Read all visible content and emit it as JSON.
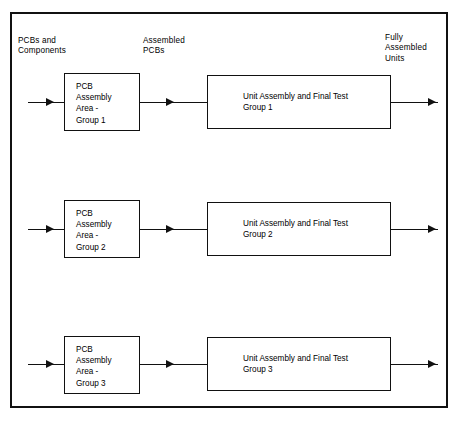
{
  "diagram": {
    "captions": {
      "inputs": "PCBs and\nComponents",
      "intermediate": "Assembled\nPCBs",
      "outputs": "Fully\nAssembled\nUnits"
    },
    "colors": {
      "background": "#ffffff",
      "line": "#111111",
      "text": "#000000",
      "frame": "#111111"
    },
    "rows": [
      {
        "id": "group-1",
        "pcb_box": "PCB\nAssembly\nArea   -\nGroup  1",
        "unit_box": "Unit Assembly  and  Final  Test\nGroup  1"
      },
      {
        "id": "group-2",
        "pcb_box": "PCB\nAssembly\nArea   -\nGroup  2",
        "unit_box": "Unit Assembly  and  Final  Test\nGroup  2"
      },
      {
        "id": "group-3",
        "pcb_box": "PCB\nAssembly\nArea   -\nGroup  3",
        "unit_box": "Unit Assembly  and  Final  Test\nGroup  3"
      }
    ]
  }
}
